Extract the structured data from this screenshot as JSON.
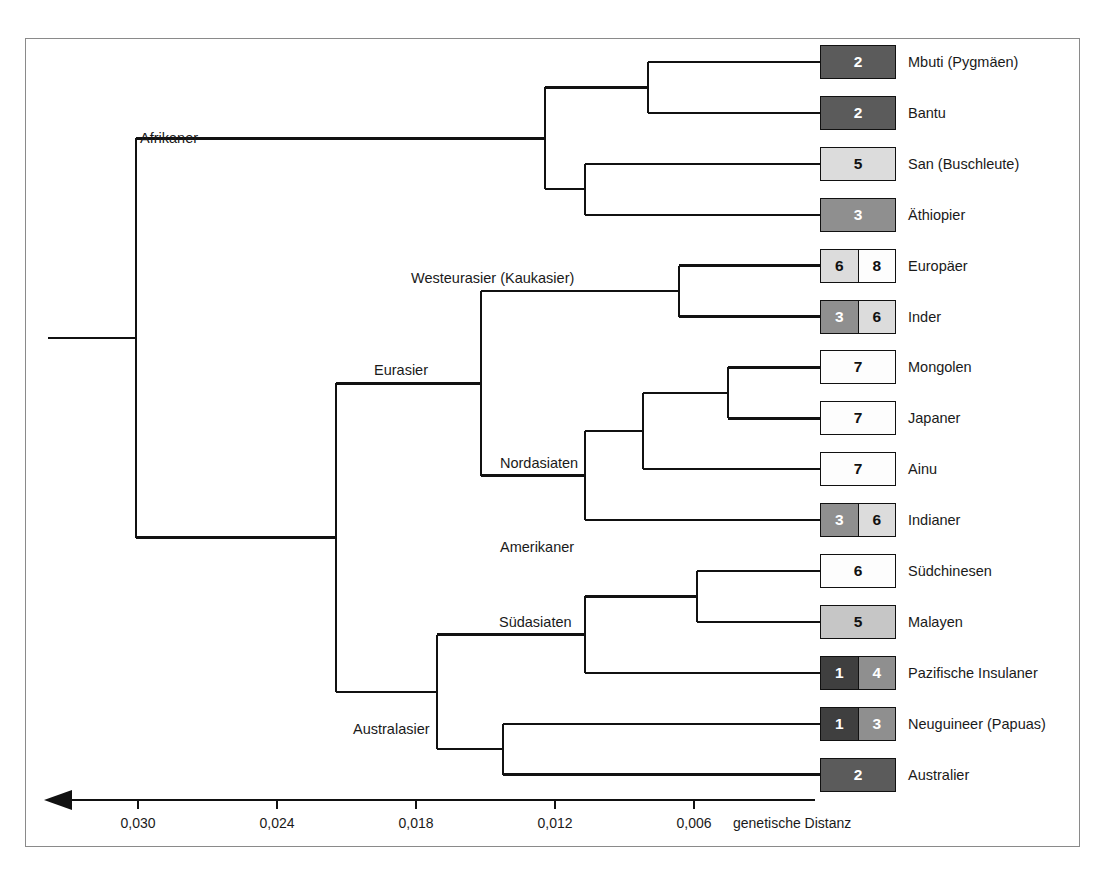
{
  "figure": {
    "kind": "phylogenetic-tree",
    "axis_title": "genetische Distanz",
    "arrow_direction": "left"
  },
  "chart_data": {
    "type": "tree",
    "title": "",
    "xlabel": "genetische Distanz",
    "ylabel": "",
    "axis_ticks": [
      "0,030",
      "0,024",
      "0,018",
      "0,012",
      "0,006"
    ],
    "axis_tick_values": [
      0.03,
      0.024,
      0.018,
      0.012,
      0.006
    ],
    "axis_direction": "decreasing-to-the-right",
    "internal_nodes": [
      {
        "name": "Afrikaner",
        "distance": 0.0285
      },
      {
        "name": "Eurasier",
        "distance": 0.0185
      },
      {
        "name": "Westeurasier (Kaukasier)",
        "distance": 0.0145
      },
      {
        "name": "Nordasiaten",
        "distance": 0.01
      },
      {
        "name": "Amerikaner",
        "distance": 0.01
      },
      {
        "name": "Australasier",
        "distance": 0.0167
      },
      {
        "name": "Südasiaten",
        "distance": 0.01
      }
    ],
    "leaves": [
      {
        "label": "Mbuti (Pygmäen)",
        "cells": [
          {
            "value": "2",
            "shade": "dark"
          }
        ]
      },
      {
        "label": "Bantu",
        "cells": [
          {
            "value": "2",
            "shade": "dark"
          }
        ]
      },
      {
        "label": "San (Buschleute)",
        "cells": [
          {
            "value": "5",
            "shade": "light"
          }
        ]
      },
      {
        "label": "Äthiopier",
        "cells": [
          {
            "value": "3",
            "shade": "medium"
          }
        ]
      },
      {
        "label": "Europäer",
        "cells": [
          {
            "value": "6",
            "shade": "light"
          },
          {
            "value": "8",
            "shade": "white"
          }
        ]
      },
      {
        "label": "Inder",
        "cells": [
          {
            "value": "3",
            "shade": "medium"
          },
          {
            "value": "6",
            "shade": "light"
          }
        ]
      },
      {
        "label": "Mongolen",
        "cells": [
          {
            "value": "7",
            "shade": "white"
          }
        ]
      },
      {
        "label": "Japaner",
        "cells": [
          {
            "value": "7",
            "shade": "white"
          }
        ]
      },
      {
        "label": "Ainu",
        "cells": [
          {
            "value": "7",
            "shade": "white"
          }
        ]
      },
      {
        "label": "Indianer",
        "cells": [
          {
            "value": "3",
            "shade": "medium"
          },
          {
            "value": "6",
            "shade": "light"
          }
        ]
      },
      {
        "label": "Südchinesen",
        "cells": [
          {
            "value": "6",
            "shade": "white"
          }
        ]
      },
      {
        "label": "Malayen",
        "cells": [
          {
            "value": "5",
            "shade": "lightmid"
          }
        ]
      },
      {
        "label": "Pazifische Insulaner",
        "cells": [
          {
            "value": "1",
            "shade": "darker"
          },
          {
            "value": "4",
            "shade": "medium"
          }
        ]
      },
      {
        "label": "Neuguineer (Papuas)",
        "cells": [
          {
            "value": "1",
            "shade": "darker"
          },
          {
            "value": "3",
            "shade": "medium"
          }
        ]
      },
      {
        "label": "Australier",
        "cells": [
          {
            "value": "2",
            "shade": "dark"
          }
        ]
      }
    ],
    "shades": {
      "white": {
        "bg": "#fdfdfd",
        "fg": "#111111"
      },
      "light": {
        "bg": "#dcdcdc",
        "fg": "#111111"
      },
      "lightmid": {
        "bg": "#c6c6c6",
        "fg": "#111111"
      },
      "medium": {
        "bg": "#8f8f8f",
        "fg": "#ffffff"
      },
      "dark": {
        "bg": "#5b5b5b",
        "fg": "#ffffff"
      },
      "darker": {
        "bg": "#3f3f3f",
        "fg": "#ffffff"
      }
    }
  },
  "geometry": {
    "chip_left": 820,
    "chip_right": 896,
    "row_top_first": 45,
    "row_step": 50.9,
    "axis_y": 800,
    "axis_left": 48,
    "axis_right": 815,
    "tick_x": [
      138,
      277,
      416,
      555,
      694
    ],
    "axis_title_x": 733,
    "root_x": 48,
    "root_y": 357
  }
}
